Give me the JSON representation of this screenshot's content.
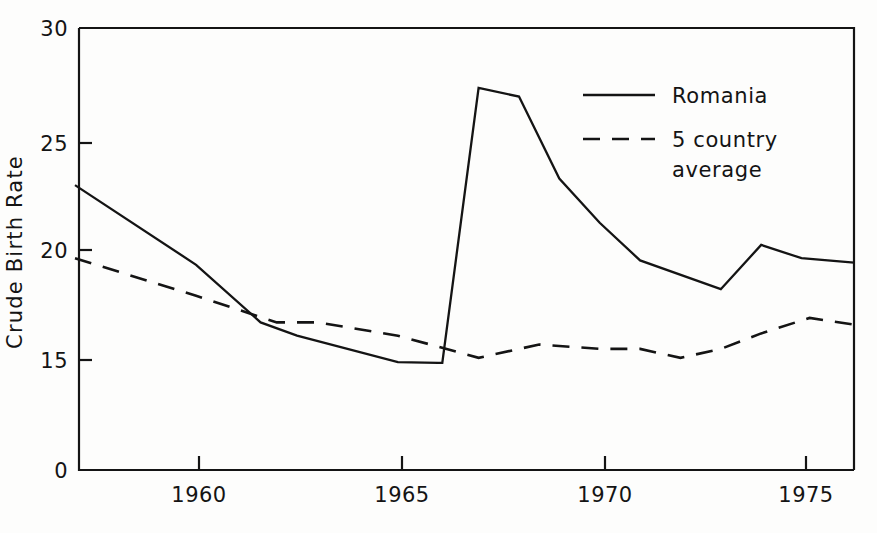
{
  "chart_data": {
    "type": "line",
    "title": "",
    "xlabel": "",
    "ylabel": "Crude Birth Rate",
    "xlim": [
      1957.1,
      1976.3
    ],
    "ylim": [
      0,
      30
    ],
    "y_axis_break": true,
    "y_ticks": [
      0,
      15,
      20,
      25,
      30
    ],
    "y_tick_labels": [
      "0",
      "15",
      "20",
      "25",
      "30"
    ],
    "x_ticks": [
      1960,
      1965,
      1970,
      1975
    ],
    "x_tick_labels": [
      "1960",
      "1965",
      "1970",
      "1975"
    ],
    "grid": false,
    "legend_position": "top-right",
    "series": [
      {
        "name": "Romania",
        "style": "solid",
        "x": [
          1957,
          1960,
          1961.6,
          1962.5,
          1965,
          1966,
          1966.1,
          1967,
          1968,
          1969,
          1970,
          1971,
          1973,
          1974,
          1975,
          1976.3
        ],
        "values": [
          22.9,
          19.3,
          16.7,
          16.1,
          14.7,
          14.6,
          14.6,
          27.3,
          26.9,
          23.2,
          21.2,
          19.5,
          18.2,
          20.2,
          19.6,
          19.4
        ]
      },
      {
        "name": "5 country average",
        "style": "dashed",
        "x": [
          1957,
          1960,
          1962,
          1963,
          1964,
          1965,
          1966,
          1967,
          1968.5,
          1970,
          1971,
          1972,
          1973,
          1974,
          1975.2,
          1976.3
        ],
        "values": [
          19.6,
          17.9,
          16.7,
          16.7,
          16.4,
          16.1,
          15.6,
          15.1,
          15.7,
          15.5,
          15.5,
          15.1,
          15.5,
          16.2,
          16.9,
          16.6
        ]
      }
    ],
    "legend": [
      {
        "label": "Romania",
        "style": "solid"
      },
      {
        "label": "5 country",
        "style": "dashed"
      },
      {
        "label": "average",
        "style": "dashed-continued"
      }
    ]
  },
  "legend": {
    "romania_label": "Romania",
    "average_label_line1": "5 country",
    "average_label_line2": "average"
  },
  "axes": {
    "y_title": "Crude Birth Rate",
    "y_labels": [
      "30",
      "25",
      "20",
      "15",
      "0"
    ],
    "x_labels": [
      "1960",
      "1965",
      "1970",
      "1975"
    ]
  },
  "colors": {
    "ink": "#141414",
    "paper": "#fdfdfc"
  }
}
